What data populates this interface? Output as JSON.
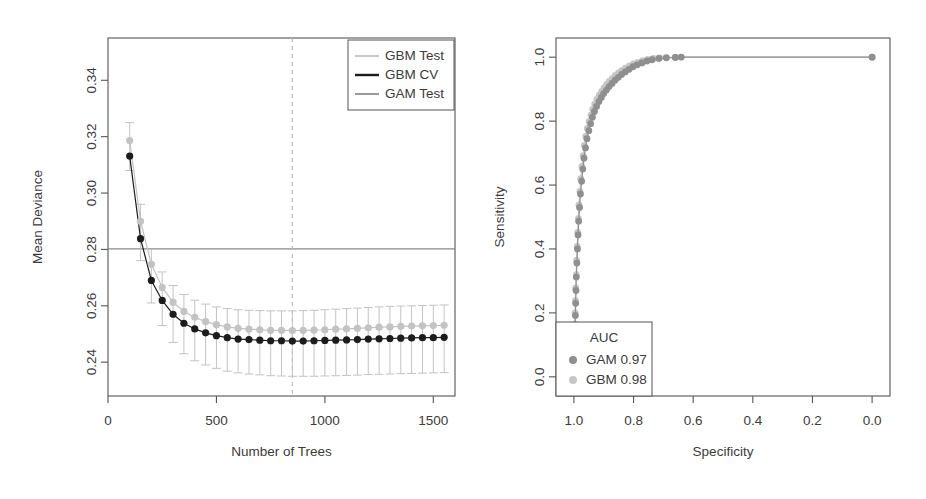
{
  "figure": {
    "background": "#ffffff",
    "width": 926,
    "height": 499
  },
  "colors": {
    "frame": "#555555",
    "text": "#3b3b3b",
    "gbm_cv": "#1c1c1c",
    "gbm_test": "#c3c3c3",
    "gam_test": "#8f8f8f",
    "hline": "#8a8a8a",
    "vline_dashed": "#b9b9b9",
    "roc_gam": "#8f8f8f",
    "roc_gbm": "#c6c6c6"
  },
  "chart_data": [
    {
      "type": "line",
      "id": "deviance-plot",
      "title": "",
      "xlabel": "Number of Trees",
      "ylabel": "Mean Deviance",
      "xlim": [
        0,
        1600
      ],
      "ylim": [
        0.228,
        0.355
      ],
      "xticks": [
        0,
        500,
        1000,
        1500
      ],
      "xtick_labels": [
        "0",
        "500",
        "1000",
        "1500"
      ],
      "yticks": [
        0.24,
        0.26,
        0.28,
        0.3,
        0.32,
        0.34
      ],
      "ytick_labels": [
        "0.24",
        "0.26",
        "0.28",
        "0.30",
        "0.32",
        "0.34"
      ],
      "grid": false,
      "legend_position": "top-right",
      "annotations": {
        "hline_y": 0.2802,
        "hline_label": "GAM Test reference deviance",
        "vline_x": 850,
        "vline_label": "optimal number of trees",
        "vline_style": "dashed"
      },
      "x": [
        100,
        150,
        200,
        250,
        300,
        350,
        400,
        450,
        500,
        550,
        600,
        650,
        700,
        750,
        800,
        850,
        900,
        950,
        1000,
        1050,
        1100,
        1150,
        1200,
        1250,
        1300,
        1350,
        1400,
        1450,
        1500,
        1550
      ],
      "series": [
        {
          "name": "GBM CV",
          "color": "#1c1c1c",
          "marker": "filled-circle",
          "values": [
            0.3131,
            0.2838,
            0.269,
            0.2619,
            0.257,
            0.2538,
            0.2518,
            0.2504,
            0.2494,
            0.2487,
            0.2482,
            0.248,
            0.2478,
            0.2476,
            0.2476,
            0.2475,
            0.2475,
            0.2476,
            0.2477,
            0.2478,
            0.2479,
            0.248,
            0.2482,
            0.2483,
            0.2484,
            0.2485,
            0.2486,
            0.2487,
            0.2487,
            0.2488
          ]
        },
        {
          "name": "GBM Test",
          "color": "#c3c3c3",
          "marker": "filled-circle",
          "values": [
            0.3186,
            0.29,
            0.2747,
            0.2665,
            0.2613,
            0.258,
            0.2559,
            0.2544,
            0.2533,
            0.2525,
            0.252,
            0.2517,
            0.2515,
            0.2513,
            0.2513,
            0.2512,
            0.2513,
            0.2514,
            0.2515,
            0.2517,
            0.2518,
            0.252,
            0.2522,
            0.2524,
            0.2525,
            0.2527,
            0.2528,
            0.2529,
            0.253,
            0.2531
          ]
        }
      ],
      "error_bars": {
        "series": "GBM CV",
        "lower": [
          0.308,
          0.276,
          0.261,
          0.253,
          0.247,
          0.243,
          0.2405,
          0.239,
          0.2378,
          0.2368,
          0.2362,
          0.2358,
          0.2355,
          0.2352,
          0.2351,
          0.235,
          0.235,
          0.235,
          0.2351,
          0.2352,
          0.2353,
          0.2354,
          0.2356,
          0.2357,
          0.2358,
          0.2359,
          0.236,
          0.2361,
          0.2362,
          0.2363
        ],
        "upper": [
          0.325,
          0.296,
          0.28,
          0.272,
          0.2672,
          0.264,
          0.262,
          0.2606,
          0.2596,
          0.259,
          0.2586,
          0.2584,
          0.2583,
          0.2582,
          0.2582,
          0.2582,
          0.2583,
          0.2584,
          0.2586,
          0.2588,
          0.259,
          0.2592,
          0.2594,
          0.2596,
          0.2598,
          0.2599,
          0.26,
          0.2601,
          0.2602,
          0.2603
        ]
      },
      "legend": [
        {
          "label": "GBM Test",
          "color": "#c3c3c3",
          "type": "line"
        },
        {
          "label": "GBM CV",
          "color": "#1c1c1c",
          "type": "line"
        },
        {
          "label": "GAM Test",
          "color": "#8f8f8f",
          "type": "line"
        }
      ]
    },
    {
      "type": "line",
      "id": "roc-plot",
      "title": "",
      "xlabel": "Specificity",
      "ylabel": "Sensitivity",
      "xlim": [
        1.06,
        -0.06
      ],
      "ylim": [
        -0.06,
        1.06
      ],
      "xticks": [
        0.0,
        0.2,
        0.4,
        0.6,
        0.8,
        1.0
      ],
      "xtick_labels": [
        "0.0",
        "0.2",
        "0.4",
        "0.6",
        "0.8",
        "1.0"
      ],
      "yticks": [
        0.0,
        0.2,
        0.4,
        0.6,
        0.8,
        1.0
      ],
      "ytick_labels": [
        "0.0",
        "0.2",
        "0.4",
        "0.6",
        "0.8",
        "1.0"
      ],
      "grid": false,
      "legend_position": "bottom-left",
      "legend_title": "AUC",
      "legend": [
        {
          "label": "GAM 0.97",
          "color": "#8f8f8f",
          "type": "point"
        },
        {
          "label": "GBM 0.98",
          "color": "#c6c6c6",
          "type": "point"
        }
      ],
      "series": [
        {
          "name": "GAM",
          "color": "#8f8f8f",
          "marker": "filled-circle",
          "points": [
            [
              0.0,
              1.0
            ],
            [
              0.64,
              1.0
            ],
            [
              0.66,
              0.999
            ],
            [
              0.69,
              0.998
            ],
            [
              0.715,
              0.996
            ],
            [
              0.738,
              0.992
            ],
            [
              0.755,
              0.988
            ],
            [
              0.772,
              0.982
            ],
            [
              0.788,
              0.976
            ],
            [
              0.802,
              0.97
            ],
            [
              0.815,
              0.962
            ],
            [
              0.828,
              0.954
            ],
            [
              0.84,
              0.946
            ],
            [
              0.851,
              0.937
            ],
            [
              0.862,
              0.928
            ],
            [
              0.872,
              0.918
            ],
            [
              0.882,
              0.908
            ],
            [
              0.891,
              0.897
            ],
            [
              0.9,
              0.886
            ],
            [
              0.908,
              0.874
            ],
            [
              0.916,
              0.861
            ],
            [
              0.924,
              0.846
            ],
            [
              0.931,
              0.83
            ],
            [
              0.938,
              0.812
            ],
            [
              0.944,
              0.792
            ],
            [
              0.95,
              0.77
            ],
            [
              0.956,
              0.745
            ],
            [
              0.961,
              0.716
            ],
            [
              0.966,
              0.684
            ],
            [
              0.97,
              0.65
            ],
            [
              0.974,
              0.612
            ],
            [
              0.978,
              0.572
            ],
            [
              0.981,
              0.53
            ],
            [
              0.984,
              0.487
            ],
            [
              0.986,
              0.444
            ],
            [
              0.988,
              0.4
            ],
            [
              0.99,
              0.356
            ],
            [
              0.992,
              0.312
            ],
            [
              0.993,
              0.27
            ],
            [
              0.994,
              0.23
            ],
            [
              0.995,
              0.192
            ],
            [
              0.996,
              0.158
            ],
            [
              0.997,
              0.126
            ],
            [
              0.998,
              0.097
            ],
            [
              0.998,
              0.072
            ],
            [
              0.999,
              0.05
            ],
            [
              0.999,
              0.032
            ],
            [
              1.0,
              0.017
            ],
            [
              1.0,
              0.006
            ],
            [
              1.0,
              0.0
            ]
          ]
        },
        {
          "name": "GBM",
          "color": "#c6c6c6",
          "marker": "filled-circle",
          "points": [
            [
              0.0,
              1.0
            ],
            [
              0.66,
              1.0
            ],
            [
              0.69,
              0.999
            ],
            [
              0.712,
              0.998
            ],
            [
              0.733,
              0.996
            ],
            [
              0.752,
              0.993
            ],
            [
              0.77,
              0.989
            ],
            [
              0.786,
              0.984
            ],
            [
              0.8,
              0.979
            ],
            [
              0.814,
              0.973
            ],
            [
              0.827,
              0.966
            ],
            [
              0.839,
              0.959
            ],
            [
              0.85,
              0.951
            ],
            [
              0.861,
              0.943
            ],
            [
              0.871,
              0.934
            ],
            [
              0.881,
              0.925
            ],
            [
              0.89,
              0.915
            ],
            [
              0.899,
              0.904
            ],
            [
              0.907,
              0.893
            ],
            [
              0.915,
              0.881
            ],
            [
              0.923,
              0.868
            ],
            [
              0.93,
              0.853
            ],
            [
              0.937,
              0.837
            ],
            [
              0.943,
              0.819
            ],
            [
              0.949,
              0.799
            ],
            [
              0.955,
              0.777
            ],
            [
              0.96,
              0.752
            ],
            [
              0.965,
              0.724
            ],
            [
              0.969,
              0.692
            ],
            [
              0.973,
              0.658
            ],
            [
              0.977,
              0.62
            ],
            [
              0.98,
              0.58
            ],
            [
              0.983,
              0.538
            ],
            [
              0.985,
              0.495
            ],
            [
              0.987,
              0.452
            ],
            [
              0.989,
              0.408
            ],
            [
              0.991,
              0.364
            ],
            [
              0.992,
              0.32
            ],
            [
              0.994,
              0.278
            ],
            [
              0.995,
              0.238
            ],
            [
              0.996,
              0.2
            ],
            [
              0.997,
              0.165
            ],
            [
              0.997,
              0.133
            ],
            [
              0.998,
              0.104
            ],
            [
              0.999,
              0.078
            ],
            [
              0.999,
              0.055
            ],
            [
              0.999,
              0.036
            ],
            [
              1.0,
              0.02
            ],
            [
              1.0,
              0.008
            ],
            [
              1.0,
              0.0
            ]
          ]
        }
      ]
    }
  ]
}
